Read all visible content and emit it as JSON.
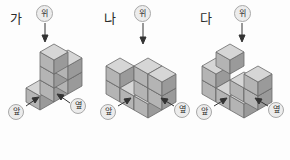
{
  "page": {
    "background_color": "#fdfdfd",
    "answer_open_paren": "(",
    "answer_close_paren": ")"
  },
  "labels": {
    "top": "위",
    "front": "앞",
    "side": "옆"
  },
  "colors": {
    "cube_top_face": "#d6d6d6",
    "cube_left_face": "#b4b4b4",
    "cube_right_face": "#9a9a9a",
    "cube_outline": "#6a6a6a",
    "bubble_fill": "#ececec",
    "bubble_border": "#a8a8a8",
    "text": "#2b2b2b",
    "arrow": "#333333"
  },
  "figures": [
    {
      "id": "fig-a",
      "letter": "가",
      "cube_count": 6,
      "description": "L-shaped stack of unit cubes in isometric view",
      "labels": {
        "top": "위",
        "front": "앞",
        "side": "옆"
      }
    },
    {
      "id": "fig-b",
      "letter": "나",
      "cube_count": 8,
      "description": "Stepped stack of unit cubes in isometric view",
      "labels": {
        "top": "위",
        "front": "앞",
        "side": "옆"
      }
    },
    {
      "id": "fig-c",
      "letter": "다",
      "cube_count": 8,
      "description": "Stepped stack of unit cubes in isometric view",
      "labels": {
        "top": "위",
        "front": "앞",
        "side": "옆"
      }
    }
  ]
}
